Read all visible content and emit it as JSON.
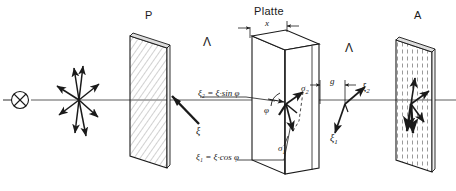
{
  "diagram": {
    "type": "optics-ray-diagram",
    "colors": {
      "line": "#1a1a1a",
      "hatch": "#9a9a9a",
      "plate_face": "#ffffff",
      "background": "#ffffff"
    },
    "labels": {
      "polarizer": "P",
      "plate": "Platte",
      "analyzer": "A",
      "lambda_left": "Λ",
      "lambda_right": "Λ",
      "thickness": "x",
      "gap": "g",
      "angle_phi": "φ",
      "xi_incident": "ξ",
      "xi_1_out": "ξ",
      "xi_1_out_sub": "1",
      "xi_2_out": "ξ",
      "xi_2_out_sub": "2",
      "sigma_1": "σ",
      "sigma_1_sub": "1",
      "sigma_2": "σ",
      "sigma_2_sub": "2",
      "formula_top": "ξ₂ = ξ·sin φ",
      "formula_bottom": "ξ₁ = ξ·cos φ"
    },
    "elements": {
      "source": "light-source-cross-circle",
      "optical_axis": "horizontal-ray-line",
      "unpolarized_star": "radiating-arrows-unpolarized-light",
      "polarizer_hatch": "diagonal-hatch",
      "analyzer_hatch": "vertical-dash-hatch"
    }
  }
}
